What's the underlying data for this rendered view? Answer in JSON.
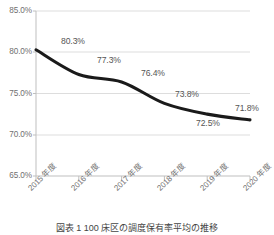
{
  "chart_data": {
    "type": "line",
    "title": "",
    "xlabel": "",
    "ylabel": "",
    "categories": [
      "2015 年度",
      "2016 年度",
      "2017 年度",
      "2018 年度",
      "2019 年度",
      "2020 年度"
    ],
    "values": [
      80.3,
      77.3,
      76.4,
      73.8,
      72.5,
      71.8
    ],
    "point_labels": [
      "80.3%",
      "77.3%",
      "76.4%",
      "73.8%",
      "72.5%",
      "71.8%"
    ],
    "ylim": [
      65.0,
      85.0
    ],
    "ytick_labels": [
      "85.0%",
      "80.0%",
      "75.0%",
      "70.0%",
      "65.0%"
    ],
    "ytick_values": [
      85.0,
      80.0,
      75.0,
      70.0,
      65.0
    ],
    "grid": true,
    "legend": false,
    "series_color": "#1a1a1a",
    "grid_color": "#d9d9d9",
    "axis_color": "#bfbfbf",
    "label_color": "#707070",
    "smoothing": true
  },
  "caption": {
    "text": "図表 1  100 床区の調度保有率平均の推移"
  }
}
